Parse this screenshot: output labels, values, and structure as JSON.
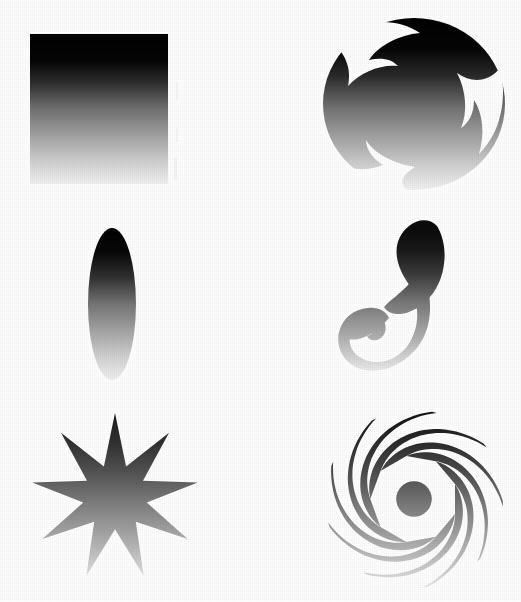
{
  "figure": {
    "background_color": "#fefefe",
    "width": 521,
    "height": 602,
    "gradient": {
      "name": "vertical-black-to-white",
      "direction": "top-to-bottom",
      "stops": [
        {
          "offset": "0%",
          "color": "#000000"
        },
        {
          "offset": "18%",
          "color": "#050505"
        },
        {
          "offset": "32%",
          "color": "#2b2b2b"
        },
        {
          "offset": "50%",
          "color": "#717171"
        },
        {
          "offset": "70%",
          "color": "#a8a8a8"
        },
        {
          "offset": "86%",
          "color": "#d2d2d2"
        },
        {
          "offset": "100%",
          "color": "#f2f2f2"
        }
      ]
    }
  },
  "shapes": [
    {
      "id": "square",
      "name": "Square",
      "row": 1,
      "column": 1,
      "bounds": {
        "x": 30,
        "y": 34,
        "width": 138,
        "height": 150
      },
      "points": null,
      "arms": null
    },
    {
      "id": "pinwheel-disc",
      "name": "Pinwheel disc",
      "row": 1,
      "column": 2,
      "bounds": {
        "x": 323,
        "y": 18,
        "width": 182,
        "height": 172
      },
      "points": null,
      "arms": 3
    },
    {
      "id": "ellipse",
      "name": "Ellipse",
      "row": 2,
      "column": 1,
      "bounds": {
        "x": 88,
        "y": 228,
        "width": 48,
        "height": 152
      },
      "points": null,
      "arms": null
    },
    {
      "id": "двух-arm-swirl",
      "name": "Two-arm swirl",
      "row": 2,
      "column": 2,
      "bounds": {
        "x": 355,
        "y": 225,
        "width": 128,
        "height": 148
      },
      "points": null,
      "arms": 2
    },
    {
      "id": "star",
      "name": "Nine-point star",
      "row": 3,
      "column": 1,
      "bounds": {
        "x": 26,
        "y": 413,
        "width": 178,
        "height": 168
      },
      "points": 9,
      "arms": null
    },
    {
      "id": "spiral-galaxy",
      "name": "Nine-arm spiral",
      "row": 3,
      "column": 2,
      "bounds": {
        "x": 325,
        "y": 410,
        "width": 178,
        "height": 178
      },
      "points": null,
      "arms": 9
    }
  ]
}
